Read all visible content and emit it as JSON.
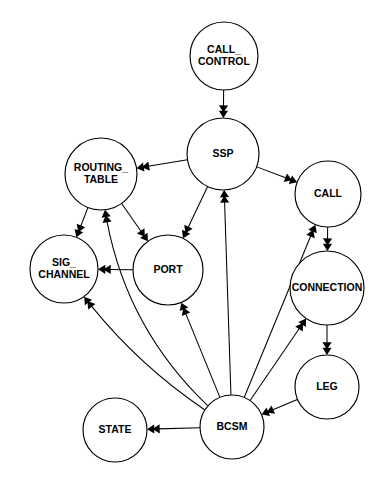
{
  "diagram": {
    "type": "directed-graph",
    "background_color": "#ffffff",
    "stroke_color": "#000000",
    "nodes": [
      {
        "id": "call_control",
        "label_lines": [
          "CALL_",
          "CONTROL"
        ],
        "label": "CALL_CONTROL",
        "cx": 224,
        "cy": 56,
        "r": 34,
        "font_size": 10.5
      },
      {
        "id": "ssp",
        "label_lines": [
          "SSP"
        ],
        "label": "SSP",
        "cx": 223,
        "cy": 154,
        "r": 36,
        "font_size": 10.5
      },
      {
        "id": "routing_table",
        "label_lines": [
          "ROUTING_",
          "TABLE"
        ],
        "label": "ROUTING_TABLE",
        "cx": 101,
        "cy": 174,
        "r": 36,
        "font_size": 10.5
      },
      {
        "id": "call",
        "label_lines": [
          "CALL"
        ],
        "label": "CALL",
        "cx": 328,
        "cy": 194,
        "r": 33,
        "font_size": 10.5
      },
      {
        "id": "sig_channel",
        "label_lines": [
          "SIG_",
          "CHANNEL"
        ],
        "label": "SIG_CHANNEL",
        "cx": 64,
        "cy": 269,
        "r": 34,
        "font_size": 10.5
      },
      {
        "id": "port",
        "label_lines": [
          "PORT"
        ],
        "label": "PORT",
        "cx": 168,
        "cy": 270,
        "r": 35,
        "font_size": 10.5
      },
      {
        "id": "connection",
        "label_lines": [
          "CONNECTION"
        ],
        "label": "CONNECTION",
        "cx": 327,
        "cy": 288,
        "r": 37,
        "font_size": 10.5
      },
      {
        "id": "leg",
        "label_lines": [
          "LEG"
        ],
        "label": "LEG",
        "cx": 327,
        "cy": 387,
        "r": 32,
        "font_size": 10.5
      },
      {
        "id": "bcsm",
        "label_lines": [
          "BCSM"
        ],
        "label": "BCSM",
        "cx": 232,
        "cy": 427,
        "r": 32,
        "font_size": 10.5
      },
      {
        "id": "state",
        "label_lines": [
          "STATE"
        ],
        "label": "STATE",
        "cx": 115,
        "cy": 430,
        "r": 32,
        "font_size": 10.5
      }
    ],
    "edges": [
      {
        "from": "call_control",
        "to": "ssp",
        "curve": 0
      },
      {
        "from": "ssp",
        "to": "routing_table",
        "curve": 0
      },
      {
        "from": "ssp",
        "to": "call",
        "curve": 0
      },
      {
        "from": "ssp",
        "to": "port",
        "curve": 0
      },
      {
        "from": "routing_table",
        "to": "sig_channel",
        "curve": 0
      },
      {
        "from": "routing_table",
        "to": "port",
        "curve": 0
      },
      {
        "from": "port",
        "to": "sig_channel",
        "curve": 0
      },
      {
        "from": "call",
        "to": "connection",
        "curve": 0
      },
      {
        "from": "connection",
        "to": "leg",
        "curve": 0
      },
      {
        "from": "leg",
        "to": "bcsm",
        "curve": 0
      },
      {
        "from": "bcsm",
        "to": "ssp",
        "curve": 0
      },
      {
        "from": "bcsm",
        "to": "call",
        "curve": 0
      },
      {
        "from": "bcsm",
        "to": "connection",
        "curve": 0
      },
      {
        "from": "bcsm",
        "to": "state",
        "curve": 0
      },
      {
        "from": "bcsm",
        "to": "port",
        "curve": 0
      },
      {
        "from": "bcsm",
        "to": "sig_channel",
        "curve": -26
      },
      {
        "from": "bcsm",
        "to": "routing_table",
        "curve": -62
      }
    ]
  }
}
